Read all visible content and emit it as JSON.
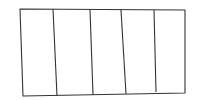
{
  "diagram": {
    "type": "sketch-rectangle-columns",
    "stroke_color": "#333333",
    "background": "#ffffff",
    "column_count": 5,
    "outline": [
      [
        20,
        9
      ],
      [
        185,
        10
      ],
      [
        185,
        93
      ],
      [
        23,
        96
      ]
    ],
    "dividers": [
      {
        "top": [
          53,
          9
        ],
        "bottom": [
          57,
          96
        ]
      },
      {
        "top": [
          90,
          9
        ],
        "bottom": [
          93,
          95
        ]
      },
      {
        "top": [
          121,
          10
        ],
        "bottom": [
          126,
          94
        ]
      },
      {
        "top": [
          154,
          10
        ],
        "bottom": [
          156,
          92
        ]
      }
    ]
  }
}
